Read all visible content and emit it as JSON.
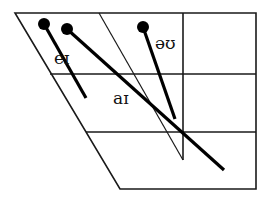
{
  "diagram": {
    "type": "vowel-quadrilateral",
    "colors": {
      "lines": "#1a1a1a",
      "glides": "#000000",
      "background": "#ffffff"
    },
    "diphthongs": [
      {
        "label": "eɪ",
        "start": [
          44,
          24
        ],
        "end": [
          86,
          98
        ],
        "label_pos": [
          54,
          58
        ]
      },
      {
        "label": "aɪ",
        "start": [
          67,
          29
        ],
        "end": [
          224,
          170
        ],
        "label_pos": [
          114,
          105
        ]
      },
      {
        "label": "əʊ",
        "start": [
          143,
          27
        ],
        "end": [
          175,
          119
        ],
        "label_pos": [
          157,
          49
        ]
      }
    ]
  }
}
